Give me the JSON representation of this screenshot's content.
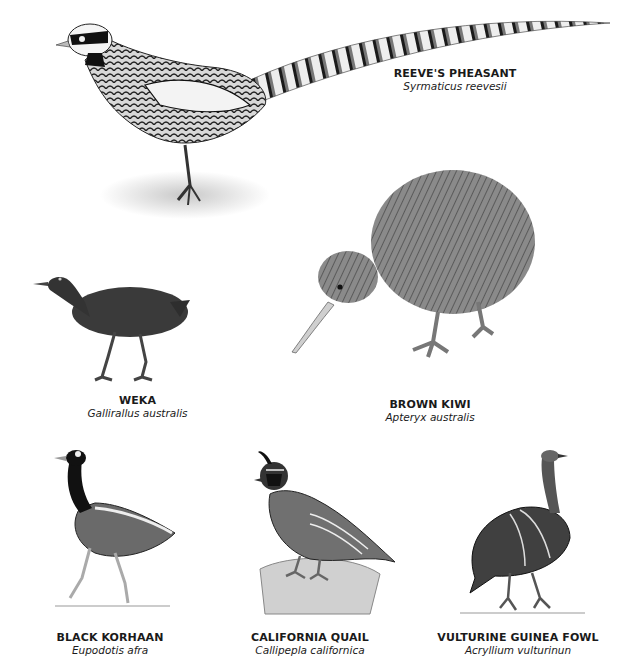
{
  "birds": [
    {
      "common_name": "REEVE'S PHEASANT",
      "scientific_name": "Syrmaticus reevesii"
    },
    {
      "common_name": "WEKA",
      "scientific_name": "Gallirallus australis"
    },
    {
      "common_name": "BROWN KIWI",
      "scientific_name": "Apteryx australis"
    },
    {
      "common_name": "BLACK KORHAAN",
      "scientific_name": "Eupodotis afra"
    },
    {
      "common_name": "CALIFORNIA QUAIL",
      "scientific_name": "Callipepla californica"
    },
    {
      "common_name": "VULTURINE GUINEA FOWL",
      "scientific_name": "Acryllium vulturinun"
    }
  ]
}
